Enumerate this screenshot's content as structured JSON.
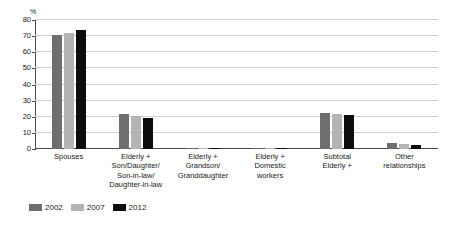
{
  "chart_data": {
    "type": "bar",
    "title": "",
    "xlabel": "",
    "ylabel": "%",
    "unit_label": "%",
    "ylim": [
      0,
      80
    ],
    "ytick_step": 10,
    "yticks": [
      80,
      70,
      60,
      50,
      40,
      30,
      20,
      10,
      0
    ],
    "grid": true,
    "grid_axis": "y",
    "legend_position": "bottom-left",
    "categories": [
      "Spouses",
      "Elderly +\nSon/Daughter/\nSon-in-law/\nDaughter-in-law",
      "Elderly +\nGrandson/\nGranddaughter",
      "Elderly +\nDomestic\nworkers",
      "Subtotal\nElderly +",
      "Other\nrelationships"
    ],
    "category_lines": [
      [
        "Spouses"
      ],
      [
        "Elderly +",
        "Son/Daughter/",
        "Son-in-law/",
        "Daughter-in-law"
      ],
      [
        "Elderly +",
        "Grandson/",
        "Granddaughter"
      ],
      [
        "Elderly +",
        "Domestic",
        "workers"
      ],
      [
        "Subtotal",
        "Elderly +"
      ],
      [
        "Other",
        "relationships"
      ]
    ],
    "series": [
      {
        "name": "2002",
        "color": "#6e6e6e",
        "values": [
          71,
          21.5,
          0.6,
          0.5,
          22.5,
          4
        ]
      },
      {
        "name": "2007",
        "color": "#b4b4b4",
        "values": [
          72,
          20.5,
          0.5,
          0.6,
          22,
          3
        ]
      },
      {
        "name": "2012",
        "color": "#0d0d0d",
        "values": [
          73.5,
          19.5,
          0.4,
          0.8,
          21,
          2.5
        ]
      }
    ]
  },
  "legend": {
    "items": [
      {
        "label": "2002",
        "color": "#6e6e6e"
      },
      {
        "label": "2007",
        "color": "#b4b4b4"
      },
      {
        "label": "2012",
        "color": "#0d0d0d"
      }
    ]
  },
  "axis": {
    "unit": "%",
    "y_labels": [
      "80",
      "70",
      "60",
      "50",
      "40",
      "30",
      "20",
      "10",
      "0"
    ]
  }
}
